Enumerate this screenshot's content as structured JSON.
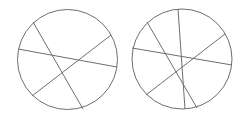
{
  "diagram": {
    "stroke_color": "#6e6e6e",
    "circles": [
      {
        "id": "left",
        "cx": 67.5,
        "cy": 59.5,
        "r": 50,
        "chords": [
          {
            "x1": 33,
            "y1": 22,
            "x2": 83,
            "y2": 109
          },
          {
            "x1": 18,
            "y1": 49,
            "x2": 117,
            "y2": 67
          },
          {
            "x1": 111,
            "y1": 35,
            "x2": 32,
            "y2": 96
          }
        ]
      },
      {
        "id": "right",
        "cx": 182,
        "cy": 59,
        "r": 50,
        "chords": [
          {
            "x1": 147,
            "y1": 22,
            "x2": 197,
            "y2": 108
          },
          {
            "x1": 132,
            "y1": 48,
            "x2": 232,
            "y2": 65
          },
          {
            "x1": 225,
            "y1": 34,
            "x2": 146,
            "y2": 95
          },
          {
            "x1": 178,
            "y1": 9,
            "x2": 185,
            "y2": 109
          }
        ]
      }
    ]
  }
}
